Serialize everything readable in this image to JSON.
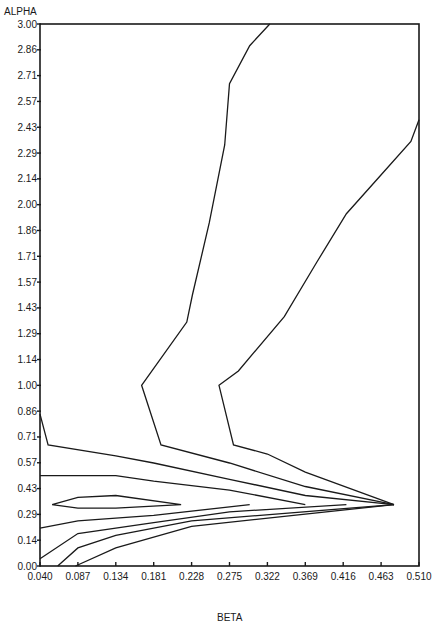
{
  "chart_data": {
    "type": "contour",
    "title": "",
    "xlabel": "BETA",
    "ylabel": "ALPHA",
    "xlim": [
      0.04,
      0.51
    ],
    "ylim": [
      0.0,
      3.0
    ],
    "grid": false,
    "legend": null,
    "x_ticks": [
      "0.040",
      "0.087",
      "0.134",
      "0.181",
      "0.228",
      "0.275",
      "0.322",
      "0.369",
      "0.416",
      "0.463",
      "0.510"
    ],
    "y_ticks": [
      "0.00",
      "0.14",
      "0.29",
      "0.43",
      "0.57",
      "0.71",
      "0.86",
      "1.00",
      "1.14",
      "1.29",
      "1.43",
      "1.57",
      "1.71",
      "1.86",
      "2.00",
      "2.14",
      "2.29",
      "2.43",
      "2.57",
      "2.71",
      "2.86",
      "3.00"
    ],
    "contours": [
      {
        "name": "contour-1",
        "points": [
          [
            0.04,
            0.84
          ],
          [
            0.05,
            0.67
          ],
          [
            0.134,
            0.61
          ],
          [
            0.181,
            0.57
          ],
          [
            0.275,
            0.48
          ],
          [
            0.369,
            0.39
          ],
          [
            0.479,
            0.34
          ]
        ]
      },
      {
        "name": "contour-2",
        "points": [
          [
            0.04,
            0.5
          ],
          [
            0.134,
            0.5
          ],
          [
            0.181,
            0.47
          ],
          [
            0.275,
            0.42
          ],
          [
            0.369,
            0.34
          ]
        ]
      },
      {
        "name": "contour-3",
        "points": [
          [
            0.055,
            0.34
          ],
          [
            0.087,
            0.38
          ],
          [
            0.134,
            0.39
          ],
          [
            0.215,
            0.34
          ],
          [
            0.134,
            0.32
          ],
          [
            0.087,
            0.32
          ],
          [
            0.055,
            0.34
          ]
        ]
      },
      {
        "name": "contour-4",
        "points": [
          [
            0.04,
            0.21
          ],
          [
            0.087,
            0.25
          ],
          [
            0.181,
            0.28
          ],
          [
            0.3,
            0.34
          ]
        ]
      },
      {
        "name": "contour-5",
        "points": [
          [
            0.04,
            0.04
          ],
          [
            0.087,
            0.18
          ],
          [
            0.181,
            0.24
          ],
          [
            0.275,
            0.3
          ],
          [
            0.42,
            0.34
          ]
        ]
      },
      {
        "name": "contour-6",
        "points": [
          [
            0.062,
            0.0
          ],
          [
            0.087,
            0.1
          ],
          [
            0.134,
            0.17
          ],
          [
            0.228,
            0.25
          ],
          [
            0.479,
            0.34
          ]
        ]
      },
      {
        "name": "contour-7",
        "points": [
          [
            0.084,
            0.0
          ],
          [
            0.134,
            0.1
          ],
          [
            0.228,
            0.22
          ],
          [
            0.479,
            0.34
          ]
        ]
      },
      {
        "name": "contour-8",
        "points": [
          [
            0.325,
            3.0
          ],
          [
            0.3,
            2.88
          ],
          [
            0.275,
            2.67
          ],
          [
            0.269,
            2.33
          ],
          [
            0.25,
            1.9
          ],
          [
            0.229,
            1.5
          ],
          [
            0.222,
            1.35
          ],
          [
            0.166,
            1.0
          ],
          [
            0.19,
            0.67
          ],
          [
            0.275,
            0.57
          ],
          [
            0.369,
            0.44
          ],
          [
            0.479,
            0.34
          ]
        ]
      },
      {
        "name": "contour-9",
        "points": [
          [
            0.51,
            2.47
          ],
          [
            0.5,
            2.35
          ],
          [
            0.462,
            2.16
          ],
          [
            0.42,
            1.95
          ],
          [
            0.383,
            1.68
          ],
          [
            0.343,
            1.38
          ],
          [
            0.286,
            1.08
          ],
          [
            0.262,
            1.0
          ],
          [
            0.28,
            0.67
          ],
          [
            0.322,
            0.62
          ],
          [
            0.369,
            0.52
          ],
          [
            0.479,
            0.34
          ]
        ]
      }
    ]
  },
  "layout": {
    "plot_left": 40,
    "plot_right": 419,
    "plot_top": 24,
    "plot_bottom": 566,
    "line_color": "#1a1a1a"
  }
}
